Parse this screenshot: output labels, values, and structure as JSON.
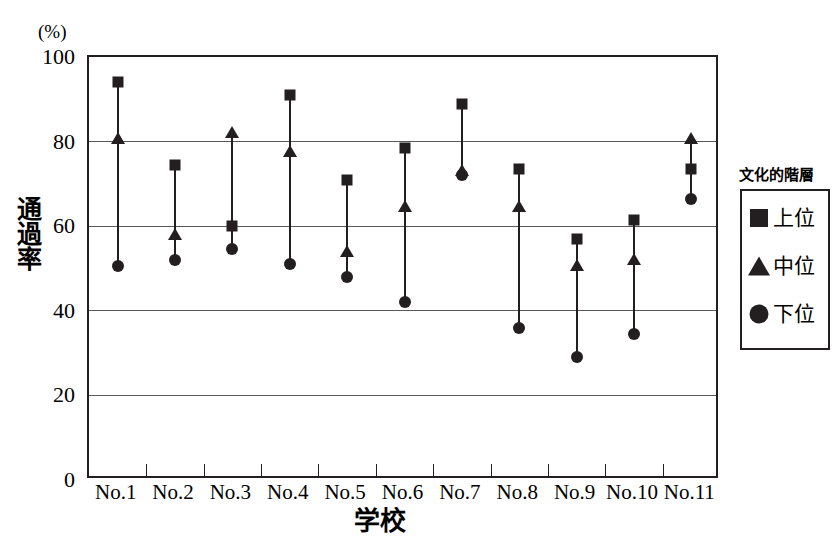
{
  "chart_data": {
    "type": "scatter",
    "title": "",
    "xlabel": "学校",
    "ylabel": "通過率",
    "unit_label": "(%)",
    "categories": [
      "No.1",
      "No.2",
      "No.3",
      "No.4",
      "No.5",
      "No.6",
      "No.7",
      "No.8",
      "No.9",
      "No.10",
      "No.11"
    ],
    "ylim": [
      0,
      100
    ],
    "yticks": [
      0,
      20,
      40,
      60,
      80,
      100
    ],
    "grid": true,
    "legend_position": "right",
    "series": [
      {
        "name": "上位",
        "marker": "square",
        "values": [
          94,
          74.5,
          60,
          91,
          71,
          78.5,
          89,
          73.5,
          57,
          61.5,
          73.5
        ]
      },
      {
        "name": "中位",
        "marker": "triangle",
        "values": [
          80.5,
          58,
          82,
          77.5,
          54,
          64.5,
          73,
          64.5,
          50.5,
          52,
          80.5
        ]
      },
      {
        "name": "下位",
        "marker": "circle",
        "values": [
          50.5,
          52,
          54.5,
          51,
          48,
          42,
          72,
          36,
          29,
          34.5,
          66.5
        ]
      }
    ]
  },
  "legend": {
    "title": "文化的階層",
    "entries": [
      {
        "label": "上位",
        "glyph": "square-marker-icon"
      },
      {
        "label": "中位",
        "glyph": "triangle-marker-icon"
      },
      {
        "label": "下位",
        "glyph": "circle-marker-icon"
      }
    ]
  },
  "colors": {
    "ink": "#231f20",
    "grid": "#58595b",
    "background": "#ffffff"
  }
}
